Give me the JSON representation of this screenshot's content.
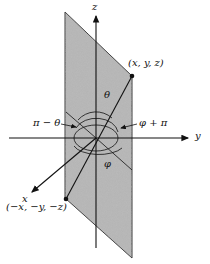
{
  "diagram": {
    "axes": {
      "z_label": "z",
      "y_label": "y",
      "x_label": "x"
    },
    "points": {
      "p1_label": "(x, y, z)",
      "p2_label": "(−x, −y, −z)"
    },
    "angles": {
      "theta": "θ",
      "pi_minus_theta": "π − θ",
      "phi": "φ",
      "phi_plus_pi": "φ + π"
    },
    "colors": {
      "plane_fill": "#a9a9a9",
      "line": "#111111",
      "background": "#ffffff"
    }
  }
}
